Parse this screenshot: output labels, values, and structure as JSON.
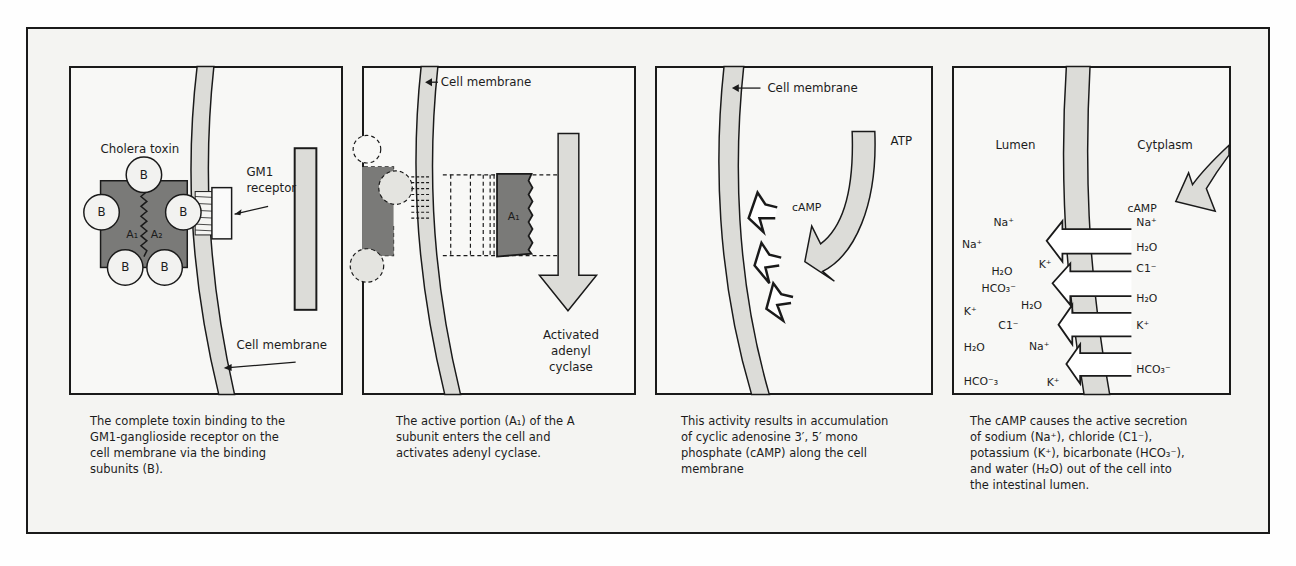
{
  "colors": {
    "membrane_fill": "#dcdcd8",
    "toxin_fill": "#7a7a78",
    "arrow_fill": "#d6d6d2",
    "outline": "#1a1a1a"
  },
  "panels": [
    {
      "labels": {
        "toxin": "Cholera toxin",
        "receptor_line1": "GM1",
        "receptor_line2": "receptor",
        "membrane": "Cell membrane",
        "b_subunit": "B",
        "a1": "A₁",
        "a2": "A₂"
      },
      "caption": "The complete toxin binding to the\nGM1-ganglioside receptor on the\ncell membrane via the binding\nsubunits (B)."
    },
    {
      "labels": {
        "membrane": "Cell membrane",
        "a1": "A₁",
        "enzyme_line1": "Activated",
        "enzyme_line2": "adenyl",
        "enzyme_line3": "cyclase"
      },
      "caption": "The active portion (A₁) of the A\nsubunit enters the cell and\nactivates adenyl cyclase."
    },
    {
      "labels": {
        "membrane": "Cell membrane",
        "atp": "ATP",
        "camp": "cAMP"
      },
      "caption": "This activity results in accumulation\nof cyclic adenosine 3′, 5′ mono\nphosphate (cAMP) along the cell\nmembrane"
    },
    {
      "labels": {
        "lumen": "Lumen",
        "cytoplasm": "Cytplasm",
        "camp": "cAMP",
        "lumen_ions": [
          "Na⁺",
          "Na⁺",
          "K⁺",
          "H₂O",
          "HCO₃⁻",
          "H₂O",
          "K⁺",
          "C1⁻",
          "H₂O",
          "Na⁺",
          "HCO⁻₃",
          "K⁺"
        ],
        "cytoplasm_ions": [
          "Na⁺",
          "H₂O",
          "C1⁻",
          "H₂O",
          "K⁺",
          "HCO₃⁻"
        ]
      },
      "caption": "The cAMP causes the active secretion\nof sodium (Na⁺), chloride (C1⁻),\npotassium (K⁺), bicarbonate (HCO₃⁻),\nand water (H₂O) out of the cell into\nthe intestinal lumen."
    }
  ]
}
